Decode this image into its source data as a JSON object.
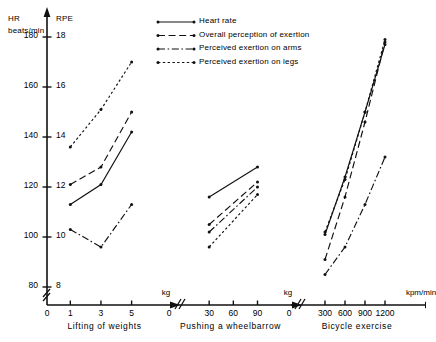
{
  "axes": {
    "left_title_line1": "HR",
    "left_title_line2": "beats/min",
    "right_title": "RPE",
    "hr_ticks": [
      180,
      160,
      140,
      120,
      100,
      80
    ],
    "rpe_ticks": [
      18,
      16,
      14,
      12,
      10,
      8
    ],
    "hr_range": [
      80,
      180
    ],
    "rpe_range": [
      8,
      18
    ]
  },
  "legend": {
    "items": [
      {
        "label": "Heart rate",
        "style": "solid",
        "key": "hr"
      },
      {
        "label": "Overall perception of exertion",
        "style": "long-dash",
        "key": "overall"
      },
      {
        "label": "Perceived exertion on arms",
        "style": "dash-dot",
        "key": "arms"
      },
      {
        "label": "Perceived exertion on legs",
        "style": "dotted",
        "key": "legs"
      }
    ]
  },
  "chart_data": {
    "type": "line",
    "title": "",
    "ylabel": "HR beats/min  /  RPE",
    "ylim": [
      80,
      180
    ],
    "rpe_ylim": [
      8,
      18
    ],
    "grid": false,
    "legend_position": "top-right",
    "panels": [
      {
        "name": "Lifting of weights",
        "xlabel": "kg",
        "xticks": [
          0,
          1,
          3,
          5
        ],
        "xlim": [
          0,
          6.2
        ],
        "axis_break": true,
        "series": [
          {
            "name": "Heart rate",
            "style": "solid",
            "scale": "HR",
            "x": [
              1,
              3,
              5
            ],
            "y": [
              113,
              121,
              142
            ]
          },
          {
            "name": "Overall perception of exertion",
            "style": "long-dash",
            "scale": "RPE",
            "x": [
              1,
              3,
              5
            ],
            "y": [
              12.1,
              12.8,
              15.0
            ]
          },
          {
            "name": "Perceived exertion on arms",
            "style": "dash-dot",
            "scale": "RPE",
            "x": [
              1,
              3,
              5
            ],
            "y": [
              10.3,
              9.6,
              11.3
            ]
          },
          {
            "name": "Perceived exertion on legs",
            "style": "dotted",
            "scale": "RPE",
            "x": [
              1,
              3,
              5
            ],
            "y": [
              13.6,
              15.1,
              17.0
            ]
          }
        ]
      },
      {
        "name": "Pushing a wheelbarrow",
        "xlabel": "kg",
        "xticks": [
          0,
          30,
          60,
          90
        ],
        "xlim": [
          0,
          108
        ],
        "axis_break": true,
        "series": [
          {
            "name": "Heart rate",
            "style": "solid",
            "scale": "HR",
            "x": [
              30,
              90
            ],
            "y": [
              116,
              128
            ]
          },
          {
            "name": "Overall perception of exertion",
            "style": "long-dash",
            "scale": "RPE",
            "x": [
              30,
              90
            ],
            "y": [
              10.5,
              12.2
            ]
          },
          {
            "name": "Perceived exertion on arms",
            "style": "dash-dot",
            "scale": "RPE",
            "x": [
              30,
              90
            ],
            "y": [
              10.2,
              12.0
            ]
          },
          {
            "name": "Perceived exertion on legs",
            "style": "dotted",
            "scale": "RPE",
            "x": [
              30,
              90
            ],
            "y": [
              9.6,
              11.7
            ]
          }
        ]
      },
      {
        "name": "Bicycle exercise",
        "xlabel": "kpm/min",
        "xticks": [
          0,
          300,
          600,
          900,
          1200
        ],
        "xlim": [
          0,
          1500
        ],
        "axis_break": true,
        "series": [
          {
            "name": "Heart rate",
            "style": "solid",
            "scale": "HR",
            "x": [
              300,
              600,
              900,
              1200
            ],
            "y": [
              101,
              124,
              150,
              177
            ]
          },
          {
            "name": "Overall perception of exertion",
            "style": "long-dash",
            "scale": "RPE",
            "x": [
              300,
              600,
              900,
              1200
            ],
            "y": [
              9.1,
              11.6,
              14.6,
              17.8
            ]
          },
          {
            "name": "Perceived exertion on arms",
            "style": "dash-dot",
            "scale": "RPE",
            "x": [
              300,
              600,
              900,
              1200
            ],
            "y": [
              8.5,
              9.6,
              11.3,
              13.2
            ]
          },
          {
            "name": "Perceived exertion on legs",
            "style": "dotted",
            "scale": "RPE",
            "x": [
              300,
              600,
              900,
              1200
            ],
            "y": [
              10.2,
              12.3,
              15.0,
              17.9
            ]
          }
        ]
      }
    ]
  }
}
